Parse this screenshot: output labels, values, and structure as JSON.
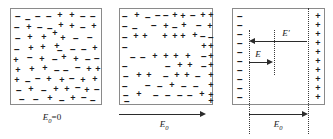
{
  "figure": {
    "background": "#ffffff",
    "border_color": "#8a8a8a",
    "charge_color": "#1a1a1a",
    "arrow_color": "#2b2b2b",
    "glyphs": {
      "plus": "+",
      "minus": "−"
    }
  },
  "panels": [
    {
      "id": "panel-1",
      "name": "no-field-panel",
      "caption": "E",
      "caption_sub": "0",
      "caption_rest": "=0",
      "caption_full": "E0=0",
      "description": "Randomly mixed positive and negative charges, no net field",
      "charges": [
        {
          "s": "-",
          "x": 18,
          "y": 16
        },
        {
          "s": "-",
          "x": 28,
          "y": 19
        },
        {
          "s": "-",
          "x": 38,
          "y": 16
        },
        {
          "s": "-",
          "x": 49,
          "y": 16
        },
        {
          "s": "+",
          "x": 60,
          "y": 15
        },
        {
          "s": "+",
          "x": 72,
          "y": 15
        },
        {
          "s": "-",
          "x": 83,
          "y": 16
        },
        {
          "s": "-",
          "x": 93,
          "y": 16
        },
        {
          "s": "-",
          "x": 17,
          "y": 27
        },
        {
          "s": "+",
          "x": 29,
          "y": 27
        },
        {
          "s": "-",
          "x": 40,
          "y": 27
        },
        {
          "s": "-",
          "x": 50,
          "y": 28
        },
        {
          "s": "+",
          "x": 61,
          "y": 25
        },
        {
          "s": "+",
          "x": 72,
          "y": 26
        },
        {
          "s": "-",
          "x": 83,
          "y": 27
        },
        {
          "s": "+",
          "x": 94,
          "y": 26
        },
        {
          "s": "-",
          "x": 18,
          "y": 38
        },
        {
          "s": "+",
          "x": 30,
          "y": 37
        },
        {
          "s": "+",
          "x": 44,
          "y": 37
        },
        {
          "s": "+",
          "x": 55,
          "y": 33
        },
        {
          "s": "+",
          "x": 63,
          "y": 38
        },
        {
          "s": "-",
          "x": 76,
          "y": 38
        },
        {
          "s": "-",
          "x": 90,
          "y": 37
        },
        {
          "s": "-",
          "x": 17,
          "y": 49
        },
        {
          "s": "+",
          "x": 31,
          "y": 48
        },
        {
          "s": "+",
          "x": 43,
          "y": 47
        },
        {
          "s": "+",
          "x": 57,
          "y": 46
        },
        {
          "s": "-",
          "x": 60,
          "y": 50
        },
        {
          "s": "-",
          "x": 73,
          "y": 49
        },
        {
          "s": "-",
          "x": 84,
          "y": 49
        },
        {
          "s": "+",
          "x": 95,
          "y": 48
        },
        {
          "s": "+",
          "x": 16,
          "y": 60
        },
        {
          "s": "-",
          "x": 30,
          "y": 57
        },
        {
          "s": "+",
          "x": 42,
          "y": 59
        },
        {
          "s": "-",
          "x": 55,
          "y": 59
        },
        {
          "s": "+",
          "x": 64,
          "y": 57
        },
        {
          "s": "+",
          "x": 76,
          "y": 59
        },
        {
          "s": "-",
          "x": 88,
          "y": 59
        },
        {
          "s": "-",
          "x": 97,
          "y": 58
        },
        {
          "s": "+",
          "x": 18,
          "y": 70
        },
        {
          "s": "+",
          "x": 32,
          "y": 69
        },
        {
          "s": "+",
          "x": 45,
          "y": 68
        },
        {
          "s": "-",
          "x": 57,
          "y": 70
        },
        {
          "s": "-",
          "x": 66,
          "y": 70
        },
        {
          "s": "-",
          "x": 78,
          "y": 67
        },
        {
          "s": "+",
          "x": 89,
          "y": 69
        },
        {
          "s": "+",
          "x": 98,
          "y": 69
        },
        {
          "s": "+",
          "x": 17,
          "y": 80
        },
        {
          "s": "-",
          "x": 28,
          "y": 81
        },
        {
          "s": "-",
          "x": 38,
          "y": 78
        },
        {
          "s": "+",
          "x": 49,
          "y": 79
        },
        {
          "s": "+",
          "x": 62,
          "y": 80
        },
        {
          "s": "-",
          "x": 72,
          "y": 78
        },
        {
          "s": "+",
          "x": 83,
          "y": 80
        },
        {
          "s": "+",
          "x": 95,
          "y": 79
        },
        {
          "s": "-",
          "x": 19,
          "y": 90
        },
        {
          "s": "+",
          "x": 31,
          "y": 89
        },
        {
          "s": "-",
          "x": 44,
          "y": 90
        },
        {
          "s": "+",
          "x": 56,
          "y": 89
        },
        {
          "s": "+",
          "x": 67,
          "y": 89
        },
        {
          "s": "-",
          "x": 78,
          "y": 87
        },
        {
          "s": "+",
          "x": 87,
          "y": 90
        },
        {
          "s": "-",
          "x": 97,
          "y": 89
        },
        {
          "s": "-",
          "x": 22,
          "y": 99
        },
        {
          "s": "-",
          "x": 36,
          "y": 99
        },
        {
          "s": "+",
          "x": 50,
          "y": 98
        },
        {
          "s": "-",
          "x": 62,
          "y": 100
        },
        {
          "s": "+",
          "x": 73,
          "y": 98
        },
        {
          "s": "-",
          "x": 84,
          "y": 97
        },
        {
          "s": "-",
          "x": 93,
          "y": 100
        }
      ]
    },
    {
      "id": "panel-2",
      "name": "polarized-panel",
      "caption": "E",
      "caption_sub": "0",
      "caption_rest": "",
      "caption_full": "E0",
      "description": "Charges separating: negatives drift left, positives drift right",
      "arrow": {
        "name": "external-field-arrow",
        "direction": "right"
      },
      "charges": [
        {
          "s": "-",
          "x": 17,
          "y": 16
        },
        {
          "s": "+",
          "x": 29,
          "y": 15
        },
        {
          "s": "-",
          "x": 40,
          "y": 17
        },
        {
          "s": "-",
          "x": 50,
          "y": 15
        },
        {
          "s": "-",
          "x": 58,
          "y": 15
        },
        {
          "s": "+",
          "x": 67,
          "y": 15
        },
        {
          "s": "+",
          "x": 75,
          "y": 16
        },
        {
          "s": "-",
          "x": 85,
          "y": 15
        },
        {
          "s": "+",
          "x": 95,
          "y": 15
        },
        {
          "s": "+",
          "x": 103,
          "y": 15
        },
        {
          "s": "-",
          "x": 17,
          "y": 26
        },
        {
          "s": "-",
          "x": 27,
          "y": 28
        },
        {
          "s": "-",
          "x": 46,
          "y": 25
        },
        {
          "s": "+",
          "x": 58,
          "y": 26
        },
        {
          "s": "-",
          "x": 67,
          "y": 27
        },
        {
          "s": "+",
          "x": 76,
          "y": 25
        },
        {
          "s": "-",
          "x": 91,
          "y": 25
        },
        {
          "s": "+",
          "x": 102,
          "y": 26
        },
        {
          "s": "-",
          "x": 17,
          "y": 37
        },
        {
          "s": "+",
          "x": 28,
          "y": 36
        },
        {
          "s": "+",
          "x": 37,
          "y": 36
        },
        {
          "s": "+",
          "x": 57,
          "y": 36
        },
        {
          "s": "+",
          "x": 67,
          "y": 36
        },
        {
          "s": "+",
          "x": 75,
          "y": 36
        },
        {
          "s": "+",
          "x": 87,
          "y": 35
        },
        {
          "s": "-",
          "x": 95,
          "y": 36
        },
        {
          "s": "-",
          "x": 103,
          "y": 37
        },
        {
          "s": "-",
          "x": 17,
          "y": 47
        },
        {
          "s": "+",
          "x": 96,
          "y": 46
        },
        {
          "s": "+",
          "x": 103,
          "y": 46
        },
        {
          "s": "-",
          "x": 25,
          "y": 57
        },
        {
          "s": "-",
          "x": 35,
          "y": 57
        },
        {
          "s": "+",
          "x": 47,
          "y": 56
        },
        {
          "s": "+",
          "x": 58,
          "y": 56
        },
        {
          "s": "+",
          "x": 68,
          "y": 56
        },
        {
          "s": "+",
          "x": 80,
          "y": 56
        },
        {
          "s": "-",
          "x": 96,
          "y": 56
        },
        {
          "s": "+",
          "x": 103,
          "y": 56
        },
        {
          "s": "-",
          "x": 17,
          "y": 66
        },
        {
          "s": "-",
          "x": 60,
          "y": 66
        },
        {
          "s": "+",
          "x": 72,
          "y": 65
        },
        {
          "s": "+",
          "x": 82,
          "y": 65
        },
        {
          "s": "-",
          "x": 96,
          "y": 66
        },
        {
          "s": "+",
          "x": 103,
          "y": 65
        },
        {
          "s": "-",
          "x": 18,
          "y": 76
        },
        {
          "s": "+",
          "x": 31,
          "y": 75
        },
        {
          "s": "+",
          "x": 41,
          "y": 75
        },
        {
          "s": "-",
          "x": 58,
          "y": 76
        },
        {
          "s": "+",
          "x": 69,
          "y": 75
        },
        {
          "s": "+",
          "x": 79,
          "y": 75
        },
        {
          "s": "-",
          "x": 90,
          "y": 76
        },
        {
          "s": "+",
          "x": 103,
          "y": 75
        },
        {
          "s": "-",
          "x": 17,
          "y": 86
        },
        {
          "s": "-",
          "x": 40,
          "y": 85
        },
        {
          "s": "-",
          "x": 52,
          "y": 86
        },
        {
          "s": "+",
          "x": 64,
          "y": 85
        },
        {
          "s": "-",
          "x": 76,
          "y": 86
        },
        {
          "s": "-",
          "x": 88,
          "y": 86
        },
        {
          "s": "+",
          "x": 103,
          "y": 85
        },
        {
          "s": "-",
          "x": 18,
          "y": 95
        },
        {
          "s": "+",
          "x": 31,
          "y": 94
        },
        {
          "s": "-",
          "x": 48,
          "y": 95
        },
        {
          "s": "-",
          "x": 60,
          "y": 95
        },
        {
          "s": "-",
          "x": 72,
          "y": 95
        },
        {
          "s": "-",
          "x": 82,
          "y": 95
        },
        {
          "s": "+",
          "x": 94,
          "y": 94
        },
        {
          "s": "+",
          "x": 103,
          "y": 95
        },
        {
          "s": "-",
          "x": 19,
          "y": 101
        },
        {
          "s": "+",
          "x": 103,
          "y": 101
        }
      ]
    },
    {
      "id": "panel-3",
      "name": "equilibrium-panel",
      "caption": "E",
      "caption_sub": "0",
      "caption_rest": "",
      "caption_full": "E0",
      "description": "Full separation: surface charge layers with internal field E and induced field E-prime",
      "inner_labels": [
        {
          "name": "induced-field-label",
          "text": "E′",
          "direction": "left"
        },
        {
          "name": "applied-field-label",
          "text": "E",
          "direction": "right"
        }
      ],
      "charges": [
        {
          "s": "-",
          "x": 22,
          "y": 16
        },
        {
          "s": "+",
          "x": 100,
          "y": 16
        },
        {
          "s": "-",
          "x": 22,
          "y": 25
        },
        {
          "s": "+",
          "x": 100,
          "y": 25
        },
        {
          "s": "-",
          "x": 22,
          "y": 34
        },
        {
          "s": "+",
          "x": 100,
          "y": 34
        },
        {
          "s": "-",
          "x": 22,
          "y": 43
        },
        {
          "s": "+",
          "x": 100,
          "y": 43
        },
        {
          "s": "-",
          "x": 22,
          "y": 52
        },
        {
          "s": "+",
          "x": 100,
          "y": 52
        },
        {
          "s": "-",
          "x": 22,
          "y": 61
        },
        {
          "s": "+",
          "x": 100,
          "y": 61
        },
        {
          "s": "-",
          "x": 22,
          "y": 70
        },
        {
          "s": "+",
          "x": 100,
          "y": 70
        },
        {
          "s": "-",
          "x": 22,
          "y": 79
        },
        {
          "s": "+",
          "x": 100,
          "y": 79
        },
        {
          "s": "-",
          "x": 22,
          "y": 88
        },
        {
          "s": "+",
          "x": 100,
          "y": 88
        },
        {
          "s": "-",
          "x": 22,
          "y": 97
        },
        {
          "s": "+",
          "x": 100,
          "y": 97
        }
      ]
    }
  ]
}
